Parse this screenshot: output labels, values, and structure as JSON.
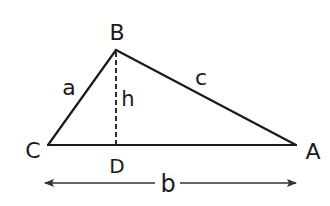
{
  "diagram": {
    "type": "triangle-with-altitude",
    "vertices": {
      "B": {
        "label": "B",
        "x": 116,
        "y": 50
      },
      "C": {
        "label": "C",
        "x": 48,
        "y": 145
      },
      "A": {
        "label": "A",
        "x": 296,
        "y": 145
      },
      "D": {
        "label": "D",
        "x": 116,
        "y": 145
      }
    },
    "sides": {
      "a": {
        "label": "a",
        "from": "C",
        "to": "B"
      },
      "c": {
        "label": "c",
        "from": "B",
        "to": "A"
      },
      "b": {
        "label": "b",
        "from": "C",
        "to": "A"
      }
    },
    "altitude": {
      "label": "h",
      "from": "B",
      "to": "D",
      "style": "dashed"
    },
    "dimension_arrow": {
      "label": "b",
      "double_headed": true
    },
    "stroke_color": "#1a1a1a",
    "background": "#ffffff"
  }
}
